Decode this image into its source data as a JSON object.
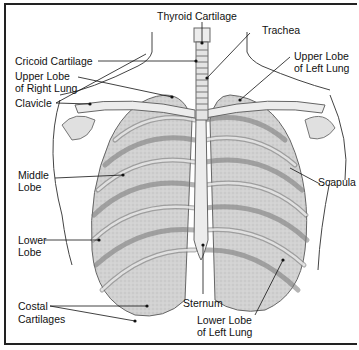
{
  "diagram": {
    "labels": {
      "thyroid_cartilage": "Thyroid Cartilage",
      "trachea": "Trachea",
      "cricoid_cartilage": "Cricoid Cartilage",
      "upper_lobe_right_1": "Upper Lobe",
      "upper_lobe_right_2": "of Right Lung",
      "upper_lobe_left_1": "Upper Lobe",
      "upper_lobe_left_2": "of Left Lung",
      "clavicle": "Clavicle",
      "middle_lobe_1": "Middle",
      "middle_lobe_2": "Lobe",
      "scapula": "Scapula",
      "lower_lobe_1": "Lower",
      "lower_lobe_2": "Lobe",
      "sternum": "Sternum",
      "costal_1": "Costal",
      "costal_2": "Cartilages",
      "lower_lobe_left_1": "Lower Lobe",
      "lower_lobe_left_2": "of Left Lung"
    },
    "colors": {
      "ink": "#111111",
      "lung": "#cfcfcf",
      "bone": "#e6e6e6",
      "outline": "#555555"
    }
  }
}
